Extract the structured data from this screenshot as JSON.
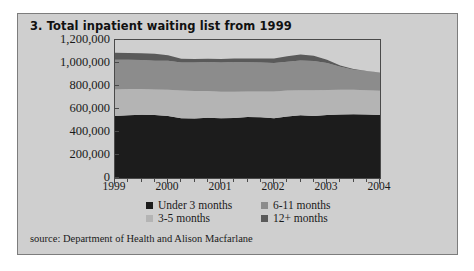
{
  "card": {
    "background_color": "#cfcfcf",
    "border_color": "#7d7d7d"
  },
  "title": "3. Total inpatient waiting list from 1999",
  "source": "source: Department of Health and Alison Macfarlane",
  "legend": {
    "items": [
      {
        "label": "Under 3 months",
        "color": "#1c1c1c"
      },
      {
        "label": "6-11 months",
        "color": "#8c8c8c"
      },
      {
        "label": "3-5 months",
        "color": "#b4b4b4"
      },
      {
        "label": "12+ months",
        "color": "#5a5a5a"
      }
    ]
  },
  "chart_data": {
    "type": "area",
    "stacked": true,
    "title": "3. Total inpatient waiting list from 1999",
    "xlabel": "",
    "ylabel": "",
    "grid": false,
    "legend_position": "bottom",
    "xlim": [
      1999,
      2004
    ],
    "ylim": [
      0,
      1200000
    ],
    "ytick_labels": [
      "1,200,000",
      "1,000,000",
      "800,000",
      "600,000",
      "400,000",
      "200,000",
      "0"
    ],
    "ytick_values": [
      1200000,
      1000000,
      800000,
      600000,
      400000,
      200000,
      0
    ],
    "xtick_labels": [
      "1999",
      "2000",
      "2001",
      "2002",
      "2003",
      "2004"
    ],
    "xtick_values": [
      1999,
      2000,
      2001,
      2002,
      2003,
      2004
    ],
    "minor_ticks_per_year": 4,
    "x": [
      1999.0,
      1999.25,
      1999.5,
      1999.75,
      2000.0,
      2000.25,
      2000.5,
      2000.75,
      2001.0,
      2001.25,
      2001.5,
      2001.75,
      2002.0,
      2002.25,
      2002.5,
      2002.75,
      2003.0,
      2003.25,
      2003.5,
      2003.75,
      2004.0
    ],
    "series": [
      {
        "name": "Under 3 months",
        "color": "#1c1c1c",
        "values": [
          540000,
          545000,
          550000,
          548000,
          540000,
          520000,
          518000,
          525000,
          520000,
          522000,
          530000,
          528000,
          520000,
          535000,
          545000,
          540000,
          548000,
          552000,
          555000,
          552000,
          548000
        ]
      },
      {
        "name": "3-5 months",
        "color": "#b4b4b4",
        "values": [
          230000,
          228000,
          225000,
          222000,
          228000,
          240000,
          238000,
          232000,
          230000,
          228000,
          222000,
          225000,
          232000,
          225000,
          218000,
          222000,
          218000,
          215000,
          212000,
          212000,
          210000
        ]
      },
      {
        "name": "6-11 months",
        "color": "#8c8c8c",
        "values": [
          258000,
          255000,
          252000,
          250000,
          252000,
          245000,
          248000,
          252000,
          255000,
          258000,
          255000,
          252000,
          248000,
          250000,
          258000,
          255000,
          235000,
          200000,
          175000,
          165000,
          160000
        ]
      },
      {
        "name": "12+ months",
        "color": "#5a5a5a",
        "values": [
          62000,
          60000,
          58000,
          60000,
          48000,
          32000,
          30000,
          28000,
          30000,
          32000,
          32000,
          35000,
          40000,
          48000,
          52000,
          45000,
          28000,
          12000,
          5000,
          2000,
          0
        ]
      }
    ],
    "totals": [
      1090000,
      1088000,
      1085000,
      1080000,
      1068000,
      1037000,
      1034000,
      1037000,
      1035000,
      1040000,
      1039000,
      1040000,
      1040000,
      1058000,
      1073000,
      1062000,
      1029000,
      979000,
      947000,
      931000,
      918000
    ]
  }
}
